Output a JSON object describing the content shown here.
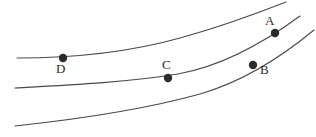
{
  "figure": {
    "type": "curve-diagram",
    "background_color": "#ffffff",
    "curve_color": "#4a4a4a",
    "point_color": "#2b2b2b",
    "label_color": "#2b2b2b",
    "width": 316,
    "height": 137
  },
  "curves": [
    {
      "name": "upper-curve",
      "path": "M 17 58 C 70 58, 130 52, 180 38 C 220 27, 258 13, 286 2"
    },
    {
      "name": "middle-curve",
      "path": "M 15 88 C 70 85, 130 82, 178 74 C 222 66, 262 44, 300 16"
    },
    {
      "name": "lower-curve",
      "path": "M 15 126 C 80 119, 150 108, 200 94 C 245 81, 285 54, 314 30"
    }
  ],
  "points": [
    {
      "name": "point-a",
      "label": "A",
      "cx": 275,
      "cy": 33,
      "r": 4.2,
      "label_x": 265,
      "label_y": 14
    },
    {
      "name": "point-b",
      "label": "B",
      "cx": 253,
      "cy": 65,
      "r": 4.2,
      "label_x": 260,
      "label_y": 63
    },
    {
      "name": "point-c",
      "label": "C",
      "cx": 168,
      "cy": 78,
      "r": 4.2,
      "label_x": 162,
      "label_y": 58
    },
    {
      "name": "point-d",
      "label": "D",
      "cx": 63,
      "cy": 58,
      "r": 4.2,
      "label_x": 56,
      "label_y": 62
    }
  ],
  "chart_data": {
    "type": "line",
    "title": "",
    "xlabel": "",
    "ylabel": "",
    "grid": false,
    "legend": "none",
    "series": [
      {
        "name": "upper-curve",
        "x": [
          17,
          70,
          120,
          180,
          230,
          286
        ],
        "y": [
          58,
          57,
          53,
          38,
          22,
          2
        ]
      },
      {
        "name": "middle-curve",
        "x": [
          15,
          70,
          120,
          178,
          230,
          300
        ],
        "y": [
          88,
          86,
          83,
          74,
          57,
          16
        ]
      },
      {
        "name": "lower-curve",
        "x": [
          15,
          80,
          140,
          200,
          260,
          314
        ],
        "y": [
          126,
          119,
          110,
          94,
          70,
          30
        ]
      }
    ],
    "annotations": [
      {
        "label": "A",
        "x": 275,
        "y": 33,
        "on_series": "middle-curve"
      },
      {
        "label": "B",
        "x": 253,
        "y": 65,
        "on_series": "lower-curve"
      },
      {
        "label": "C",
        "x": 168,
        "y": 78,
        "on_series": "middle-curve"
      },
      {
        "label": "D",
        "x": 63,
        "y": 58,
        "on_series": "upper-curve"
      }
    ]
  }
}
